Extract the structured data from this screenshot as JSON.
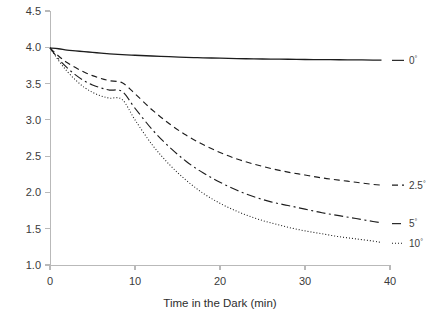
{
  "chart_data": {
    "type": "line",
    "title": "",
    "xlabel": "Time in the Dark (min)",
    "ylabel": "",
    "xlim": [
      0,
      40
    ],
    "ylim": [
      1.0,
      4.5
    ],
    "grid": false,
    "legend_position": "right-inline",
    "x_ticks": [
      "0",
      "10",
      "20",
      "30",
      "40"
    ],
    "x_tick_values": [
      0,
      10,
      20,
      30,
      40
    ],
    "y_ticks": [
      "1.0",
      "1.5",
      "2.0",
      "2.5",
      "3.0",
      "3.5",
      "4.0",
      "4.5"
    ],
    "y_tick_values": [
      1.0,
      1.5,
      2.0,
      2.5,
      3.0,
      3.5,
      4.0,
      4.5
    ],
    "x": [
      0,
      1,
      2,
      3,
      4,
      5,
      6,
      7,
      8.5,
      10,
      12,
      14,
      16,
      18,
      20,
      22,
      24,
      26,
      28,
      30,
      32,
      34,
      36,
      38,
      39
    ],
    "series": [
      {
        "name": "0",
        "label": "0",
        "degree_symbol": "°",
        "style": "solid",
        "values": [
          3.99,
          3.98,
          3.96,
          3.95,
          3.94,
          3.93,
          3.92,
          3.91,
          3.9,
          3.89,
          3.88,
          3.87,
          3.86,
          3.855,
          3.85,
          3.845,
          3.84,
          3.838,
          3.835,
          3.832,
          3.83,
          3.828,
          3.826,
          3.824,
          3.823
        ],
        "label_y": 3.82
      },
      {
        "name": "2.5",
        "label": "2.5",
        "degree_symbol": "°",
        "style": "dashed",
        "values": [
          3.99,
          3.88,
          3.79,
          3.72,
          3.66,
          3.61,
          3.57,
          3.54,
          3.51,
          3.36,
          3.14,
          2.95,
          2.79,
          2.66,
          2.55,
          2.46,
          2.39,
          2.33,
          2.28,
          2.24,
          2.2,
          2.17,
          2.14,
          2.11,
          2.1
        ],
        "label_y": 2.1
      },
      {
        "name": "5",
        "label": "5",
        "degree_symbol": "°",
        "style": "dash-dot",
        "values": [
          3.99,
          3.84,
          3.72,
          3.62,
          3.54,
          3.48,
          3.44,
          3.41,
          3.39,
          3.16,
          2.87,
          2.63,
          2.43,
          2.27,
          2.14,
          2.03,
          1.94,
          1.87,
          1.82,
          1.77,
          1.72,
          1.68,
          1.64,
          1.6,
          1.58
        ],
        "label_y": 1.57
      },
      {
        "name": "10",
        "label": "10",
        "degree_symbol": "°",
        "style": "dotted",
        "values": [
          3.99,
          3.82,
          3.67,
          3.55,
          3.45,
          3.38,
          3.33,
          3.3,
          3.28,
          3.0,
          2.66,
          2.39,
          2.17,
          1.99,
          1.85,
          1.74,
          1.65,
          1.58,
          1.52,
          1.47,
          1.43,
          1.39,
          1.36,
          1.33,
          1.31
        ],
        "label_y": 1.3
      }
    ]
  }
}
